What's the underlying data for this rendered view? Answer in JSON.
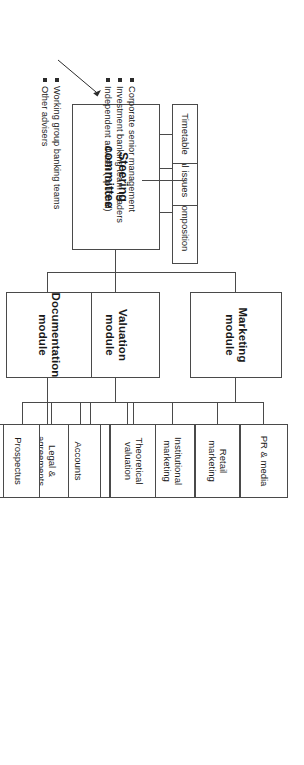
{
  "diagram": {
    "type": "organization-chart",
    "root": {
      "label": "Steering\ncommittee",
      "label_line1": "Steering",
      "label_line2": "committee"
    },
    "root_attachments": [
      {
        "label": "Board composition"
      },
      {
        "label": "Critical issues"
      },
      {
        "label": "Timetable"
      }
    ],
    "modules": [
      {
        "label_line1": "Marketing",
        "label_line2": "module",
        "children": [
          {
            "label": "Pre-IPO"
          },
          {
            "label_line1": "Institutional",
            "label_line2": "marketing"
          },
          {
            "label_line1": "Retail",
            "label_line2": "marketing"
          },
          {
            "label": "PR & media"
          }
        ]
      },
      {
        "label_line1": "Valuation",
        "label_line2": "module",
        "children": [
          {
            "label_line1": "Financial",
            "label_line2": "model"
          },
          {
            "label_line1": "Theoretical",
            "label_line2": "valuation"
          }
        ]
      },
      {
        "label_line1": "Documentation",
        "label_line2": "module",
        "children": [
          {
            "label_line1": "Due",
            "label_line2": "diligence"
          },
          {
            "label": "Prospectus"
          },
          {
            "label_line1": "Legal &",
            "label_line2": "agreements"
          },
          {
            "label": "Accounts"
          }
        ]
      }
    ],
    "legend_groups": [
      {
        "target": "steering-committee",
        "items": [
          "Corporate senior management",
          "Investment banking team leaders",
          "Independent adviser (optional)"
        ]
      },
      {
        "target": "documentation-module",
        "items": [
          "Working group banking teams",
          "Other advisers"
        ]
      }
    ],
    "colors": {
      "line": "#4a4a4a",
      "text": "#1a1a1a",
      "background": "#ffffff",
      "bullet": "#2b2b2b"
    }
  }
}
